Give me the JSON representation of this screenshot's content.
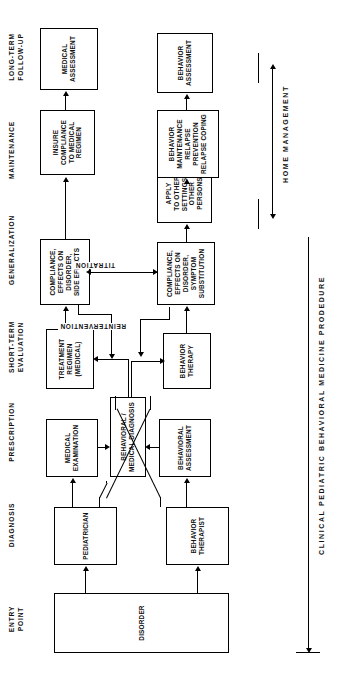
{
  "figure": {
    "caption": "CLINICAL PEDIATRIC BEHAVIORAL MEDICINE PRODEDURE",
    "bracket_label": "HOME MANAGEMENT"
  },
  "stage_headers": [
    {
      "id": "entry-point",
      "label": "ENTRY\nPOINT"
    },
    {
      "id": "diagnosis",
      "label": "DIAGNOSIS"
    },
    {
      "id": "prescription",
      "label": "PRESCRIPTION"
    },
    {
      "id": "short-term",
      "label": "SHORT-TERM\nEVALUATION"
    },
    {
      "id": "generalization",
      "label": "GENERALIZATION"
    },
    {
      "id": "maintenance",
      "label": "MAINTENANCE"
    },
    {
      "id": "long-term-followup",
      "label": "LONG-TERM\nFOLLOW-UP"
    }
  ],
  "nodes": {
    "disorder": "DISORDER",
    "pediatrician": "PEDIATRICIAN",
    "behavior_therapist": "BEHAVIOR\nTHERAPIST",
    "medical_examination": "MEDICAL\nEXAMINATION",
    "behavioral_medical_diagnosis": "BEHAVIORAL /\nMEDICAL DIAGNOSIS",
    "behavioral_assessment": "BEHAVIORAL\nASSESSMENT",
    "treatment_regimen": "TREATMENT\nREGIMEN\n(MEDICAL)",
    "behavior_therapy": "BEHAVIOR\nTHERAPY",
    "compliance_medical": "COMPLIANCE,\nEFFECTS ON\nDISORDER,\nSIDE EFFECTS",
    "compliance_behavioral": "COMPLIANCE,\nEFFECTS ON\nDISORDER,\nSYMPTOM\nSUBSTITUTION",
    "apply_other": "APPLY\nTO OTHER\nSETTINGS,\nOTHER\nPERSONS",
    "insure_compliance": "INSURE\nCOMPLIANCE\nTO MEDICAL\nREGIMEN",
    "behavior_maintenance": "BEHAVIOR\nMAINTENANCE\nRELAPSE\nPREVENTION\nRELAPSE COPING",
    "medical_assessment": "MEDICAL\nASSESSMENT",
    "behavior_assessment": "BEHAVIOR\nASSESSMENT"
  },
  "edge_labels": {
    "titration": "TITRATION",
    "reintervention": "REINTERVENTION"
  },
  "colors": {
    "stroke": "#000000",
    "background": "#ffffff",
    "text": "#111111"
  }
}
